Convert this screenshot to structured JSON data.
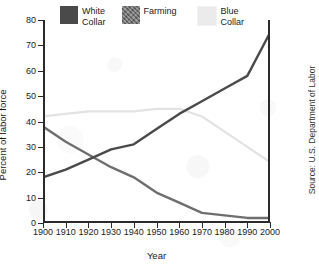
{
  "figure": {
    "xlabel": "Year",
    "ylabel": "Percent of labor force",
    "source_note": "Source: U.S. Department of Labor"
  },
  "legend": {
    "entries": [
      {
        "label": "White\nCollar",
        "color": "#4a4a4a",
        "name": "white-collar"
      },
      {
        "label": "Farming",
        "color": "#6e6e6e",
        "name": "farming"
      },
      {
        "label": "Blue\nCollar",
        "color": "#ebebeb",
        "name": "blue-collar"
      }
    ]
  },
  "axes": {
    "y_ticks": [
      "80",
      "70",
      "60",
      "50",
      "40",
      "30",
      "20",
      "10",
      "0"
    ],
    "x_ticks": [
      "1900",
      "1910",
      "1920",
      "1930",
      "1940",
      "1950",
      "1960",
      "1970",
      "1980",
      "1990",
      "2000"
    ]
  },
  "chart_data": {
    "type": "line",
    "title": "",
    "subtitle": "",
    "xlabel": "Year",
    "ylabel": "Percent of labor force",
    "xlim": [
      1900,
      2000
    ],
    "ylim": [
      0,
      80
    ],
    "grid": false,
    "legend_position": "top",
    "x": [
      1900,
      1910,
      1920,
      1930,
      1940,
      1950,
      1960,
      1970,
      1980,
      1990,
      2000
    ],
    "series": [
      {
        "name": "White Collar",
        "color": "#4a4a4a",
        "values": [
          18,
          21,
          25,
          29,
          31,
          37,
          43,
          48,
          53,
          58,
          75
        ]
      },
      {
        "name": "Farming",
        "color": "#6e6e6e",
        "values": [
          38,
          32,
          27,
          22,
          18,
          12,
          8,
          4,
          3,
          2,
          2
        ]
      },
      {
        "name": "Blue Collar",
        "color": "#e2e2e2",
        "values": [
          42,
          43,
          44,
          44,
          44,
          45,
          45,
          42,
          36,
          30,
          24
        ]
      }
    ],
    "annotations": [
      "Source: U.S. Department of Labor"
    ]
  }
}
